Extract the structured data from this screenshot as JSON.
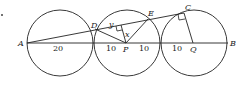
{
  "diagram": {
    "type": "geometry",
    "points": {
      "A": "A",
      "B": "B",
      "C": "C",
      "D": "D",
      "E": "E",
      "P": "P",
      "Q": "Q"
    },
    "variables": {
      "y": "y",
      "x": "x"
    },
    "segment_labels": {
      "AP_part": "20",
      "left_of_P": "10",
      "right_of_P": "10",
      "left_of_Q": "10"
    },
    "colors": {
      "stroke": "#222222",
      "background": "#ffffff"
    }
  }
}
